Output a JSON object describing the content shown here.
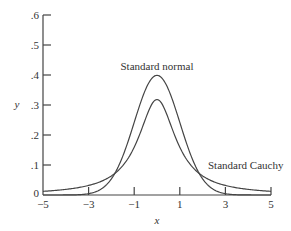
{
  "chart_data": {
    "type": "line",
    "title": "",
    "xlabel": "x",
    "ylabel": "y",
    "xlim": [
      -5,
      5
    ],
    "ylim": [
      0,
      0.6
    ],
    "grid": false,
    "x_ticks": [
      "-5",
      "-3",
      "-1",
      "1",
      "3",
      "5"
    ],
    "x_tick_values": [
      -5,
      -3,
      -1,
      1,
      3,
      5
    ],
    "y_ticks": [
      "0",
      ".1",
      ".2",
      ".3",
      ".4",
      ".5",
      ".6"
    ],
    "y_tick_values": [
      0,
      0.1,
      0.2,
      0.3,
      0.4,
      0.5,
      0.6
    ],
    "series": [
      {
        "name": "Standard normal",
        "function": "exp(-x^2/2)/sqrt(2*pi)",
        "x": [
          -5,
          -4,
          -3,
          -2,
          -1.5,
          -1,
          -0.5,
          0,
          0.5,
          1,
          1.5,
          2,
          3,
          4,
          5
        ],
        "values": [
          0.0,
          0.0001,
          0.0044,
          0.054,
          0.1295,
          0.242,
          0.3521,
          0.3989,
          0.3521,
          0.242,
          0.1295,
          0.054,
          0.0044,
          0.0001,
          0.0
        ]
      },
      {
        "name": "Standard Cauchy",
        "function": "1/(pi*(1+x^2))",
        "x": [
          -5,
          -4,
          -3,
          -2,
          -1.5,
          -1,
          -0.5,
          0,
          0.5,
          1,
          1.5,
          2,
          3,
          4,
          5
        ],
        "values": [
          0.0122,
          0.0187,
          0.0318,
          0.0637,
          0.0979,
          0.1592,
          0.2546,
          0.3183,
          0.2546,
          0.1592,
          0.0979,
          0.0637,
          0.0318,
          0.0187,
          0.0122
        ]
      }
    ],
    "annotations": [
      {
        "text": "Standard normal",
        "near": "peak of taller curve"
      },
      {
        "text": "Standard Cauchy",
        "near": "right tail"
      }
    ],
    "legend": "none (direct labels)"
  },
  "labels": {
    "xlabel": "x",
    "ylabel": "y",
    "normal": "Standard normal",
    "cauchy": "Standard Cauchy",
    "xticks": [
      "−5",
      "−3",
      "−1",
      "1",
      "3",
      "5"
    ],
    "yticks": [
      "0",
      ".1",
      ".2",
      ".3",
      ".4",
      ".5",
      ".6"
    ]
  }
}
